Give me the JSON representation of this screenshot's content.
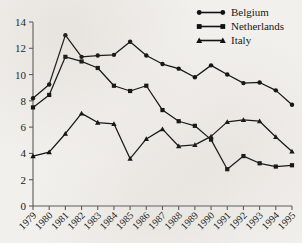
{
  "chart_data": {
    "type": "line",
    "title": "",
    "subtitle": "",
    "xlabel": "",
    "ylabel": "",
    "x": [
      "1979",
      "1980",
      "1981",
      "1982",
      "1983",
      "1984",
      "1985",
      "1986",
      "1987",
      "1988",
      "1989",
      "1990",
      "1991",
      "1992",
      "1993",
      "1994",
      "1995"
    ],
    "xlim": [
      1979,
      1995
    ],
    "ylim": [
      0,
      14
    ],
    "yticks": [
      0,
      2,
      4,
      6,
      8,
      10,
      12,
      14
    ],
    "ytick_labels": [
      "0",
      "2",
      "4",
      "6",
      "8",
      "10",
      "12",
      "14"
    ],
    "grid": false,
    "legend_position": "top-right",
    "series": [
      {
        "name": "Belgium",
        "marker": "circle",
        "color": "#111111",
        "values": [
          8.2,
          9.25,
          13.0,
          11.35,
          11.45,
          11.5,
          12.5,
          11.45,
          10.8,
          10.45,
          9.8,
          10.7,
          10.0,
          9.35,
          9.4,
          8.8,
          7.7
        ]
      },
      {
        "name": "Netherlands",
        "marker": "square",
        "color": "#111111",
        "values": [
          7.5,
          8.45,
          11.35,
          11.0,
          10.5,
          9.15,
          8.75,
          9.15,
          7.3,
          6.45,
          6.1,
          5.05,
          2.8,
          3.8,
          3.25,
          3.0,
          3.1
        ]
      },
      {
        "name": "Italy",
        "marker": "triangle",
        "color": "#111111",
        "values": [
          3.8,
          4.1,
          5.5,
          7.05,
          6.35,
          6.25,
          3.6,
          5.1,
          5.85,
          4.55,
          4.65,
          5.3,
          6.4,
          6.55,
          6.45,
          5.25,
          4.15
        ]
      }
    ]
  },
  "legend": {
    "items": [
      {
        "label": "Belgium",
        "marker": "circle-marker-icon"
      },
      {
        "label": "Netherlands",
        "marker": "square-marker-icon"
      },
      {
        "label": "Italy",
        "marker": "triangle-marker-icon"
      }
    ]
  },
  "axes": {
    "y_axis_name": "y-axis",
    "x_axis_name": "x-axis"
  }
}
